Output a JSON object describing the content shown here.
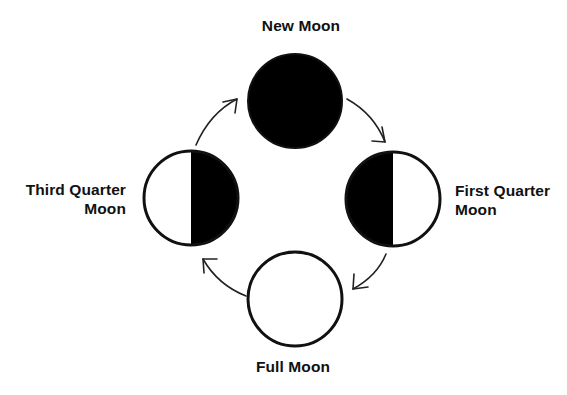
{
  "diagram": {
    "type": "lunar-phase-cycle",
    "direction": "clockwise",
    "colors": {
      "background": "#ffffff",
      "dark": "#000000",
      "lit": "#ffffff",
      "stroke": "#111111",
      "text": "#111111"
    },
    "phases": [
      {
        "id": "new",
        "label_lines": [
          "New Moon"
        ],
        "shading": "fully-dark"
      },
      {
        "id": "first-quarter",
        "label_lines": [
          "First Quarter",
          "Moon"
        ],
        "shading": "left-half-dark"
      },
      {
        "id": "full",
        "label_lines": [
          "Full Moon"
        ],
        "shading": "fully-lit"
      },
      {
        "id": "third-quarter",
        "label_lines": [
          "Third Quarter",
          "Moon"
        ],
        "shading": "right-half-dark"
      }
    ],
    "arrows": [
      {
        "from": "third-quarter",
        "to": "new"
      },
      {
        "from": "new",
        "to": "first-quarter"
      },
      {
        "from": "first-quarter",
        "to": "full"
      },
      {
        "from": "full",
        "to": "third-quarter"
      }
    ]
  }
}
